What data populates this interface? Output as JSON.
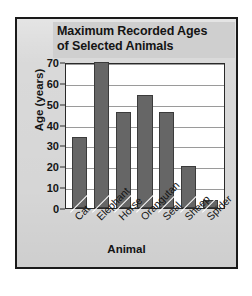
{
  "chart_data": {
    "type": "bar",
    "title": "Maximum Recorded Ages\nof Selected Animals",
    "title_line1": "Maximum Recorded Ages",
    "title_line2": "of Selected Animals",
    "xlabel": "Animal",
    "ylabel": "Age (years)",
    "categories": [
      "Cat",
      "Elephant",
      "Horse",
      "Orangutan",
      "Seal",
      "Sheep",
      "Spider"
    ],
    "values": [
      34,
      70,
      46,
      54,
      46,
      20,
      4
    ],
    "ylim": [
      0,
      70
    ],
    "ytick_step": 10,
    "yticks": [
      70,
      60,
      50,
      40,
      30,
      20,
      10,
      0
    ],
    "grid": true,
    "grid_orientation": "horizontal",
    "legend": null,
    "xtick_rotation": -45,
    "colors": {
      "bar_fill": "#666666",
      "bar_edge": "#3b3b3b",
      "plot_background": "#ffffff",
      "panel_background": "#d9d9d9",
      "title_band": "#cfcfcf",
      "frame": "#1a1a1a",
      "gridline": "#9a9a9a",
      "text": "#141414"
    }
  }
}
